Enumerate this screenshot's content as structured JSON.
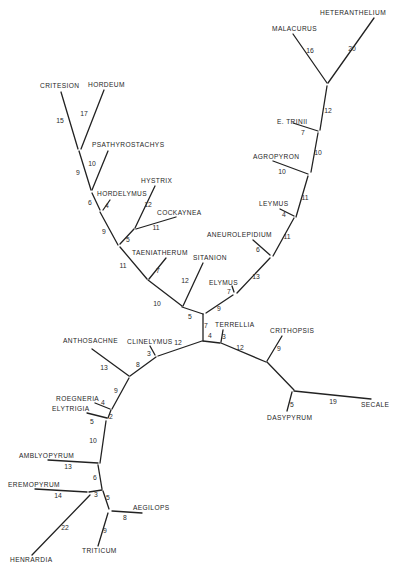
{
  "figure": {
    "type": "unrooted phylogenetic tree",
    "line_color": "#222222",
    "text_color": "#1e1e1e",
    "background": "#ffffff"
  },
  "taxa": [
    {
      "id": "heteranthelium",
      "label": "HETERANTHELIUM",
      "x": 320,
      "y": 15,
      "anchor": "start"
    },
    {
      "id": "malacurus",
      "label": "MALACURUS",
      "x": 272,
      "y": 31,
      "anchor": "start"
    },
    {
      "id": "critesion",
      "label": "CRITESION",
      "x": 40,
      "y": 88,
      "anchor": "start"
    },
    {
      "id": "hordeum",
      "label": "HORDEUM",
      "x": 88,
      "y": 87,
      "anchor": "start"
    },
    {
      "id": "e-trinii",
      "label": "E. TRINII",
      "x": 277,
      "y": 124,
      "anchor": "start"
    },
    {
      "id": "psathyrostachys",
      "label": "PSATHYROSTACHYS",
      "x": 92,
      "y": 147,
      "anchor": "start"
    },
    {
      "id": "agropyron",
      "label": "AGROPYRON",
      "x": 253,
      "y": 159,
      "anchor": "start"
    },
    {
      "id": "hystrix",
      "label": "HYSTRIX",
      "x": 141,
      "y": 183,
      "anchor": "start"
    },
    {
      "id": "hordelymus",
      "label": "HORDELYMUS",
      "x": 97,
      "y": 196,
      "anchor": "start"
    },
    {
      "id": "leymus",
      "label": "LEYMUS",
      "x": 259,
      "y": 206,
      "anchor": "start"
    },
    {
      "id": "cockaynea",
      "label": "COCKAYNEA",
      "x": 157,
      "y": 215,
      "anchor": "start"
    },
    {
      "id": "aneurolepidium",
      "label": "ANEUROLEPIDIUM",
      "x": 207,
      "y": 237,
      "anchor": "start"
    },
    {
      "id": "taeniatherum",
      "label": "TAENIATHERUM",
      "x": 132,
      "y": 255,
      "anchor": "start"
    },
    {
      "id": "sitanion",
      "label": "SITANION",
      "x": 193,
      "y": 260,
      "anchor": "start"
    },
    {
      "id": "elymus",
      "label": "ELYMUS",
      "x": 209,
      "y": 285,
      "anchor": "start"
    },
    {
      "id": "terrellia",
      "label": "TERRELLIA",
      "x": 215,
      "y": 327,
      "anchor": "start"
    },
    {
      "id": "anthosachne",
      "label": "ANTHOSACHNE",
      "x": 63,
      "y": 343,
      "anchor": "start"
    },
    {
      "id": "clinelymus",
      "label": "CLINELYMUS",
      "x": 127,
      "y": 344,
      "anchor": "start"
    },
    {
      "id": "crithopsis",
      "label": "CRITHOPSIS",
      "x": 270,
      "y": 333,
      "anchor": "start"
    },
    {
      "id": "roegneria",
      "label": "ROEGNERIA",
      "x": 56,
      "y": 401,
      "anchor": "start"
    },
    {
      "id": "elytrigia",
      "label": "ELYTRIGIA",
      "x": 52,
      "y": 411,
      "anchor": "start"
    },
    {
      "id": "secale",
      "label": "SECALE",
      "x": 361,
      "y": 407,
      "anchor": "start"
    },
    {
      "id": "dasypyrum",
      "label": "DASYPYRUM",
      "x": 267,
      "y": 420,
      "anchor": "start"
    },
    {
      "id": "amblyopyrum",
      "label": "AMBLYOPYRUM",
      "x": 19,
      "y": 458,
      "anchor": "start"
    },
    {
      "id": "eremopyrum",
      "label": "EREMOPYRUM",
      "x": 8,
      "y": 487,
      "anchor": "start"
    },
    {
      "id": "aegilops",
      "label": "AEGILOPS",
      "x": 133,
      "y": 510,
      "anchor": "start"
    },
    {
      "id": "triticum",
      "label": "TRITICUM",
      "x": 82,
      "y": 553,
      "anchor": "start"
    },
    {
      "id": "henrardia",
      "label": "HENRARDIA",
      "x": 10,
      "y": 562,
      "anchor": "start"
    }
  ],
  "branches": [
    {
      "id": "b-heteranthelium",
      "from": [
        374,
        18
      ],
      "to": [
        328,
        83
      ],
      "length": "20",
      "lx": 352,
      "ly": 51
    },
    {
      "id": "b-malacurus",
      "from": [
        293,
        34
      ],
      "to": [
        327,
        83
      ],
      "length": "16",
      "lx": 310,
      "ly": 53
    },
    {
      "id": "b-12-upper",
      "from": [
        327,
        86
      ],
      "to": [
        320,
        130
      ],
      "length": "12",
      "lx": 328,
      "ly": 113
    },
    {
      "id": "b-e-trinii",
      "from": [
        293,
        123
      ],
      "to": [
        318,
        131
      ],
      "length": "7",
      "lx": 303,
      "ly": 135
    },
    {
      "id": "b-10-mid",
      "from": [
        318,
        133
      ],
      "to": [
        311,
        172
      ],
      "length": "10",
      "lx": 318,
      "ly": 155
    },
    {
      "id": "b-agropyron",
      "from": [
        273,
        161
      ],
      "to": [
        308,
        174
      ],
      "length": "10",
      "lx": 282,
      "ly": 174
    },
    {
      "id": "b-11-a",
      "from": [
        308,
        176
      ],
      "to": [
        296,
        217
      ],
      "length": "11",
      "lx": 305,
      "ly": 200
    },
    {
      "id": "b-leymus",
      "from": [
        280,
        209
      ],
      "to": [
        294,
        216
      ],
      "length": "4",
      "lx": 284,
      "ly": 217
    },
    {
      "id": "b-11-b",
      "from": [
        294,
        218
      ],
      "to": [
        273,
        256
      ],
      "length": "11",
      "lx": 287,
      "ly": 239
    },
    {
      "id": "b-aneurolepidium",
      "from": [
        253,
        240
      ],
      "to": [
        270,
        255
      ],
      "length": "6",
      "lx": 258,
      "ly": 252
    },
    {
      "id": "b-13",
      "from": [
        270,
        258
      ],
      "to": [
        237,
        293
      ],
      "length": "13",
      "lx": 256,
      "ly": 279
    },
    {
      "id": "b-elymus",
      "from": [
        232,
        286
      ],
      "to": [
        234,
        292
      ],
      "length": "7",
      "lx": 229,
      "ly": 294
    },
    {
      "id": "b-9-center",
      "from": [
        233,
        295
      ],
      "to": [
        206,
        313
      ],
      "length": "9",
      "lx": 219,
      "ly": 311
    },
    {
      "id": "b-sitanion",
      "from": [
        203,
        263
      ],
      "to": [
        183,
        306
      ],
      "length": "12",
      "lx": 185,
      "ly": 283
    },
    {
      "id": "b-5-center",
      "from": [
        182,
        307
      ],
      "to": [
        203,
        314
      ],
      "length": "5",
      "lx": 190,
      "ly": 319
    },
    {
      "id": "b-7-center",
      "from": [
        203,
        314
      ],
      "to": [
        203,
        341
      ],
      "length": "7",
      "lx": 206,
      "ly": 328
    },
    {
      "id": "b-10-left",
      "from": [
        148,
        280
      ],
      "to": [
        182,
        306
      ],
      "length": "10",
      "lx": 157,
      "ly": 306
    },
    {
      "id": "b-taeniatherum",
      "from": [
        166,
        258
      ],
      "to": [
        149,
        279
      ],
      "length": "7",
      "lx": 158,
      "ly": 273
    },
    {
      "id": "b-11-left",
      "from": [
        120,
        247
      ],
      "to": [
        147,
        279
      ],
      "length": "11",
      "lx": 123,
      "ly": 268
    },
    {
      "id": "b-5-hystrix-node",
      "from": [
        134,
        229
      ],
      "to": [
        120,
        244
      ],
      "length": "5",
      "lx": 128,
      "ly": 242
    },
    {
      "id": "b-hystrix",
      "from": [
        155,
        186
      ],
      "to": [
        135,
        228
      ],
      "length": "12",
      "lx": 148,
      "ly": 207
    },
    {
      "id": "b-cockaynea",
      "from": [
        176,
        217
      ],
      "to": [
        136,
        229
      ],
      "length": "11",
      "lx": 156,
      "ly": 230
    },
    {
      "id": "b-9-left",
      "from": [
        100,
        212
      ],
      "to": [
        118,
        245
      ],
      "length": "9",
      "lx": 104,
      "ly": 234
    },
    {
      "id": "b-hordelymus",
      "from": [
        110,
        200
      ],
      "to": [
        103,
        210
      ],
      "length": "4",
      "lx": 107,
      "ly": 208
    },
    {
      "id": "b-6",
      "from": [
        92,
        193
      ],
      "to": [
        100,
        210
      ],
      "length": "6",
      "lx": 90,
      "ly": 205
    },
    {
      "id": "b-psathyrostachys",
      "from": [
        108,
        151
      ],
      "to": [
        92,
        190
      ],
      "length": "10",
      "lx": 92,
      "ly": 166
    },
    {
      "id": "b-9-top",
      "from": [
        79,
        151
      ],
      "to": [
        91,
        190
      ],
      "length": "9",
      "lx": 78,
      "ly": 175
    },
    {
      "id": "b-critesion",
      "from": [
        61,
        92
      ],
      "to": [
        78,
        149
      ],
      "length": "15",
      "lx": 60,
      "ly": 123
    },
    {
      "id": "b-hordeum",
      "from": [
        104,
        90
      ],
      "to": [
        81,
        149
      ],
      "length": "17",
      "lx": 84,
      "ly": 116
    },
    {
      "id": "b-4-terrellia",
      "from": [
        203,
        341
      ],
      "to": [
        220,
        343
      ],
      "length": "4",
      "lx": 210,
      "ly": 338
    },
    {
      "id": "b-terrellia",
      "from": [
        223,
        330
      ],
      "to": [
        221,
        342
      ],
      "length": "3",
      "lx": 224,
      "ly": 339
    },
    {
      "id": "b-12-right",
      "from": [
        221,
        343
      ],
      "to": [
        266,
        362
      ],
      "length": "12",
      "lx": 240,
      "ly": 350
    },
    {
      "id": "b-crithopsis",
      "from": [
        282,
        336
      ],
      "to": [
        267,
        361
      ],
      "length": "9",
      "lx": 279,
      "ly": 351
    },
    {
      "id": "b-to-secale-node",
      "from": [
        267,
        362
      ],
      "to": [
        294,
        390
      ],
      "length": "",
      "lx": 0,
      "ly": 0
    },
    {
      "id": "b-secale",
      "from": [
        294,
        391
      ],
      "to": [
        371,
        399
      ],
      "length": "19",
      "lx": 333,
      "ly": 404
    },
    {
      "id": "b-dasypyrum",
      "from": [
        292,
        392
      ],
      "to": [
        287,
        411
      ],
      "length": "5",
      "lx": 292,
      "ly": 407
    },
    {
      "id": "b-12-clinelymus",
      "from": [
        202,
        341
      ],
      "to": [
        158,
        356
      ],
      "length": "12",
      "lx": 178,
      "ly": 345
    },
    {
      "id": "b-clinelymus",
      "from": [
        150,
        346
      ],
      "to": [
        155,
        355
      ],
      "length": "3",
      "lx": 149,
      "ly": 356
    },
    {
      "id": "b-8",
      "from": [
        156,
        357
      ],
      "to": [
        130,
        376
      ],
      "length": "8",
      "lx": 138,
      "ly": 367
    },
    {
      "id": "b-anthosachne",
      "from": [
        92,
        349
      ],
      "to": [
        129,
        376
      ],
      "length": "13",
      "lx": 104,
      "ly": 370
    },
    {
      "id": "b-9-lower",
      "from": [
        129,
        378
      ],
      "to": [
        112,
        409
      ],
      "length": "9",
      "lx": 116,
      "ly": 393
    },
    {
      "id": "b-roegneria",
      "from": [
        95,
        403
      ],
      "to": [
        110,
        409
      ],
      "length": "4",
      "lx": 103,
      "ly": 405
    },
    {
      "id": "b-2",
      "from": [
        111,
        410
      ],
      "to": [
        108,
        418
      ],
      "length": "2",
      "lx": 111,
      "ly": 419
    },
    {
      "id": "b-elytrigia",
      "from": [
        87,
        413
      ],
      "to": [
        107,
        418
      ],
      "length": "5",
      "lx": 92,
      "ly": 424
    },
    {
      "id": "b-10-lower",
      "from": [
        106,
        421
      ],
      "to": [
        100,
        463
      ],
      "length": "10",
      "lx": 93,
      "ly": 443
    },
    {
      "id": "b-amblyopyrum",
      "from": [
        48,
        460
      ],
      "to": [
        98,
        463
      ],
      "length": "13",
      "lx": 68,
      "ly": 469
    },
    {
      "id": "b-6-lower",
      "from": [
        98,
        465
      ],
      "to": [
        102,
        489
      ],
      "length": "6",
      "lx": 95,
      "ly": 480
    },
    {
      "id": "b-eremopyrum",
      "from": [
        35,
        489
      ],
      "to": [
        87,
        492
      ],
      "length": "14",
      "lx": 58,
      "ly": 498
    },
    {
      "id": "b-3",
      "from": [
        89,
        492
      ],
      "to": [
        102,
        490
      ],
      "length": "3",
      "lx": 96,
      "ly": 497
    },
    {
      "id": "b-henrardia",
      "from": [
        90,
        495
      ],
      "to": [
        32,
        555
      ],
      "length": "22",
      "lx": 65,
      "ly": 530
    },
    {
      "id": "b-5-lower",
      "from": [
        103,
        491
      ],
      "to": [
        109,
        509
      ],
      "length": "5",
      "lx": 108,
      "ly": 500
    },
    {
      "id": "b-aegilops",
      "from": [
        112,
        511
      ],
      "to": [
        142,
        513
      ],
      "length": "8",
      "lx": 125,
      "ly": 520
    },
    {
      "id": "b-triticum",
      "from": [
        108,
        513
      ],
      "to": [
        98,
        546
      ],
      "length": "9",
      "lx": 105,
      "ly": 533
    }
  ]
}
